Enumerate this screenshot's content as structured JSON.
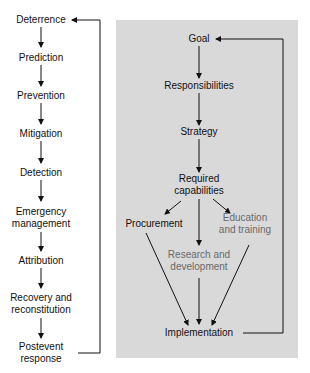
{
  "left_chain": {
    "title": "Event phases",
    "items": [
      {
        "label": "Deterrence"
      },
      {
        "label": "Prediction"
      },
      {
        "label": "Prevention"
      },
      {
        "label": "Mitigation"
      },
      {
        "label": "Detection"
      },
      {
        "label": "Emergency management",
        "line1": "Emergency",
        "line2": "management"
      },
      {
        "label": "Attribution"
      },
      {
        "label": "Recovery and reconstitution",
        "line1": "Recovery and",
        "line2": "reconstitution"
      },
      {
        "label": "Postevent response",
        "line1": "Postevent",
        "line2": "response"
      }
    ],
    "feedback": "Postevent response loops back to Deterrence"
  },
  "right_panel": {
    "background": "#d9d9d9",
    "nodes": {
      "goal": "Goal",
      "responsibilities": "Responsibilities",
      "strategy": "Strategy",
      "required_line1": "Required",
      "required_line2": "capabilities",
      "procurement": "Procurement",
      "education_line1": "Education",
      "education_line2": "and training",
      "research_line1": "Research and",
      "research_line2": "development",
      "implementation": "Implementation"
    },
    "feedback": "Implementation loops back to Goal",
    "grey_text_color": "#6a6a6a"
  }
}
